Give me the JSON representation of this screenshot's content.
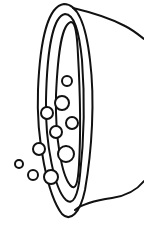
{
  "illustration": {
    "subject": "bowl-with-bubbles",
    "stroke_color": "#111111",
    "fill_color": "#ffffff",
    "bubbles": [
      {
        "cx": 67,
        "cy": 81,
        "r": 5
      },
      {
        "cx": 62,
        "cy": 103,
        "r": 7
      },
      {
        "cx": 47,
        "cy": 113,
        "r": 6
      },
      {
        "cx": 72,
        "cy": 123,
        "r": 6
      },
      {
        "cx": 56,
        "cy": 132,
        "r": 6
      },
      {
        "cx": 39,
        "cy": 149,
        "r": 6
      },
      {
        "cx": 66,
        "cy": 154,
        "r": 8
      },
      {
        "cx": 19,
        "cy": 164,
        "r": 4
      },
      {
        "cx": 33,
        "cy": 175,
        "r": 5
      },
      {
        "cx": 51,
        "cy": 177,
        "r": 7
      }
    ]
  }
}
